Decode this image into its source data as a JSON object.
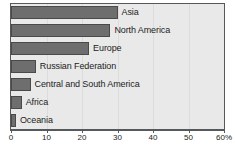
{
  "chart_data": {
    "type": "bar",
    "orientation": "horizontal",
    "title": "",
    "subtitle": "",
    "xlabel": "",
    "ylabel": "",
    "xlim": [
      0,
      60
    ],
    "grid": true,
    "legend": null,
    "axis_unit": "%",
    "categories": [
      "Asia",
      "North America",
      "Europe",
      "Russian Federation",
      "Central and South America",
      "Africa",
      "Oceania"
    ],
    "values": [
      30,
      28,
      22,
      7,
      5.5,
      3,
      1.4
    ],
    "tick_values": [
      0,
      10,
      20,
      30,
      40,
      50,
      60
    ],
    "tick_labels": [
      "0",
      "10",
      "20",
      "30",
      "40",
      "50",
      "60%"
    ],
    "colors": {
      "bar_fill": "#6e6e6e",
      "bar_border": "#4a4a4a",
      "plot_background": "#e9e9e9",
      "plot_border": "#55595c",
      "gridline": "#dcdcdc",
      "text": "#1c1c1c"
    }
  }
}
